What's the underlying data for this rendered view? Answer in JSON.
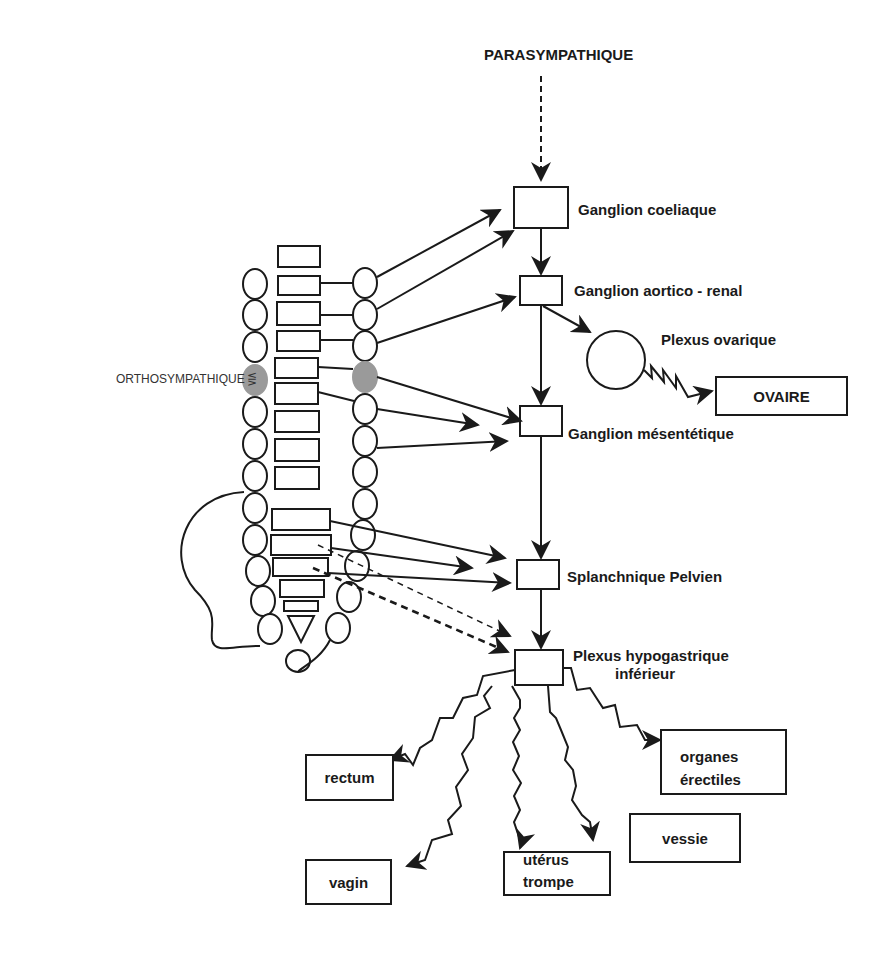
{
  "title": "PARASYMPATHIQUE",
  "side_label": "ORTHOSYMPATHIQUE",
  "ganglia": [
    {
      "id": "coeliaque",
      "label": "Ganglion coeliaque"
    },
    {
      "id": "aortico-renal",
      "label": "Ganglion aortico - renal"
    },
    {
      "id": "mesentetique",
      "label": "Ganglion mésentétique"
    },
    {
      "id": "splanchnique",
      "label": "Splanchnique Pelvien"
    },
    {
      "id": "hypogastrique",
      "label_line1": "Plexus hypogastrique",
      "label_line2": "inférieur"
    }
  ],
  "plexus_ovarique": {
    "label": "Plexus ovarique"
  },
  "ovaire": {
    "label": "OVAIRE"
  },
  "targets": {
    "rectum": "rectum",
    "vagin": "vagin",
    "uterus_line1": "utérus",
    "uterus_line2": "trompe",
    "vessie": "vessie",
    "organes_line1": "organes",
    "organes_line2": "érectiles"
  },
  "colors": {
    "stroke": "#1a1a1a",
    "highlight": "#9a9a9a"
  }
}
